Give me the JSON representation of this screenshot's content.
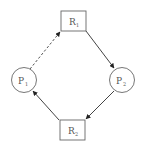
{
  "diagram": {
    "type": "resource-allocation-graph",
    "colors": {
      "stroke": "#555555",
      "edge": "#333333",
      "background": "#ffffff"
    },
    "nodes": [
      {
        "id": "R1",
        "kind": "resource",
        "label": "R",
        "sub": "1"
      },
      {
        "id": "P1",
        "kind": "process",
        "label": "P",
        "sub": "1"
      },
      {
        "id": "P2",
        "kind": "process",
        "label": "P",
        "sub": "2"
      },
      {
        "id": "R2",
        "kind": "resource",
        "label": "R",
        "sub": "2"
      }
    ],
    "edges": [
      {
        "from": "P1",
        "to": "R1",
        "style": "dashed",
        "meaning": "claim"
      },
      {
        "from": "R1",
        "to": "P2",
        "style": "solid",
        "meaning": "assignment"
      },
      {
        "from": "P2",
        "to": "R2",
        "style": "solid",
        "meaning": "request"
      },
      {
        "from": "R2",
        "to": "P1",
        "style": "solid",
        "meaning": "assignment"
      }
    ]
  }
}
